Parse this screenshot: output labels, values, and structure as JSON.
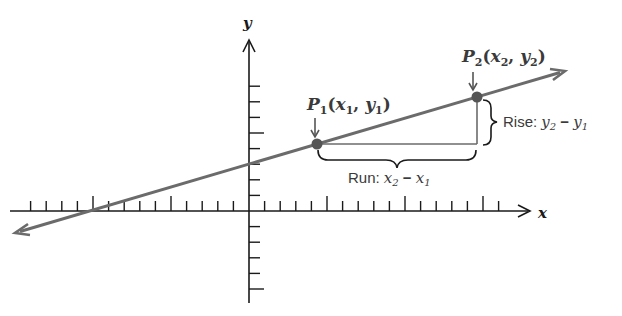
{
  "diagram": {
    "axes": {
      "x_label": "x",
      "y_label": "y",
      "x_axis_y_px": 211,
      "y_axis_x_px": 249,
      "tick_spacing_px": 15.6,
      "major_tick_every": 5
    },
    "line": {
      "start": [
        15,
        233
      ],
      "end": [
        565,
        71
      ],
      "color": "#6b6b6b"
    },
    "points": {
      "p1": {
        "label_main": "P",
        "label_sub": "1",
        "coords_text": "(x",
        "cx": 317,
        "cy": 144
      },
      "p2": {
        "label_main": "P",
        "label_sub": "2",
        "cx": 477,
        "cy": 97
      }
    },
    "labels": {
      "p1_P": "P",
      "p1_sub": "1",
      "p1_open": "(",
      "p1_x": "x",
      "p1_x_sub": "1",
      "p1_comma": ", ",
      "p1_y": "y",
      "p1_y_sub": "1",
      "p1_close": ")",
      "p2_P": "P",
      "p2_sub": "2",
      "p2_open": "(",
      "p2_x": "x",
      "p2_x_sub": "2",
      "p2_comma": ", ",
      "p2_y": "y",
      "p2_y_sub": "2",
      "p2_close": ")",
      "rise_word": "Rise: ",
      "rise_y2": "y",
      "rise_y2_sub": "2",
      "rise_minus": " − ",
      "rise_y1": "y",
      "rise_y1_sub": "1",
      "run_word": "Run: ",
      "run_x2": "x",
      "run_x2_sub": "2",
      "run_minus": " − ",
      "run_x1": "x",
      "run_x1_sub": "1"
    },
    "colors": {
      "axis": "#1a1a1a",
      "line": "#6b6b6b",
      "point": "#555555",
      "triangle": "#6b6b6b",
      "text": "#3a3a3a"
    }
  }
}
